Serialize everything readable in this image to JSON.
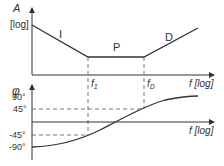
{
  "diagram": {
    "colors": {
      "line": "#333333",
      "dashed": "#555555",
      "background": "#ffffff"
    },
    "amplitude_plot": {
      "y_label": "A",
      "y_unit": "[log]",
      "x_label": "f [log]",
      "regions": [
        "I",
        "P",
        "D"
      ],
      "breakpoints": [
        "f",
        "f"
      ],
      "breakpoint_subscripts": [
        "1",
        "D"
      ]
    },
    "phase_plot": {
      "y_label": "φ",
      "x_label": "f [log]",
      "ticks": [
        "90°",
        "45°",
        "-45°",
        "-90°"
      ]
    }
  }
}
